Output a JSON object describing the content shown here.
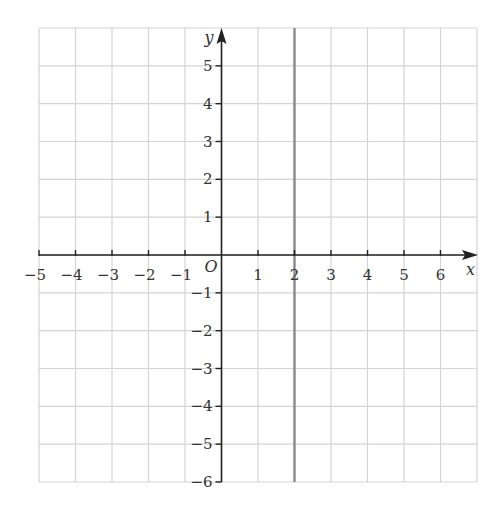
{
  "chart_data": {
    "type": "line",
    "title": "",
    "xlabel": "x",
    "ylabel": "y",
    "origin_label": "O",
    "xlim": [
      -5,
      7
    ],
    "ylim": [
      -6,
      6
    ],
    "x_ticks": [
      -5,
      -4,
      -3,
      -2,
      -1,
      1,
      2,
      3,
      4,
      5,
      6
    ],
    "y_ticks": [
      5,
      4,
      3,
      2,
      1,
      -1,
      -2,
      -3,
      -4,
      -5,
      -6
    ],
    "grid": true,
    "series": [
      {
        "name": "x = 2",
        "kind": "vertical-line",
        "x": 2,
        "y_range": [
          -6,
          6
        ],
        "color": "#888888"
      }
    ]
  },
  "colors": {
    "grid": "#d4d4d4",
    "axis": "#222222",
    "line": "#8a8a8a",
    "text": "#333333"
  },
  "layout": {
    "x0px": 39,
    "x1px": 477,
    "y0px": 28,
    "y1px": 482,
    "origin_x": 221,
    "origin_y": 255
  }
}
